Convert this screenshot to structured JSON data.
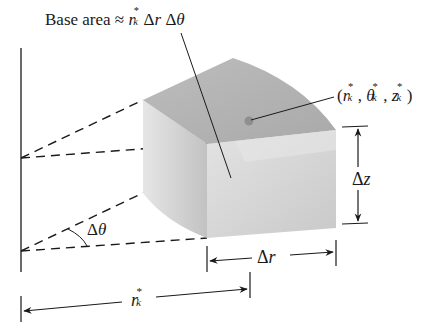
{
  "figure": {
    "labels": {
      "base_area_prefix": "Base area ≈ ",
      "base_area_expr": "r_k* Δr Δθ",
      "r_symbol": "r",
      "sub_k": "k",
      "star": "*",
      "delta_r": "Δr",
      "delta_theta": "Δθ",
      "delta_z": "Δz",
      "point_label": "(r_k*, θ_k*, z_k*)",
      "theta_symbol": "θ",
      "z_symbol": "z",
      "delta": "Δ"
    },
    "colors": {
      "ink": "#1a1a1a",
      "top_face": "#b4b4b4",
      "front_face": "#d4d4d4",
      "left_face": "#dcdcdc",
      "point": "#8f8f8f"
    }
  }
}
